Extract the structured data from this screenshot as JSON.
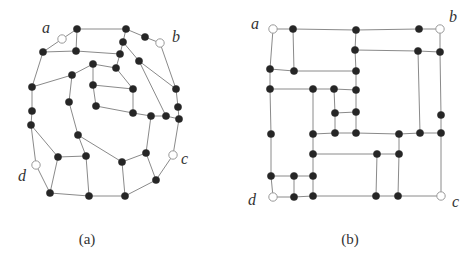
{
  "figures": [
    {
      "id": "a",
      "caption": "(a)",
      "caption_pos": [
        87,
        244
      ],
      "terminal_labels": [
        {
          "text": "a",
          "x": 42,
          "y": 33
        },
        {
          "text": "b",
          "x": 172,
          "y": 42
        },
        {
          "text": "c",
          "x": 181,
          "y": 164
        },
        {
          "text": "d",
          "x": 18,
          "y": 181
        }
      ],
      "nodes": [
        {
          "id": "A",
          "x": 62,
          "y": 39,
          "terminal": true
        },
        {
          "id": "B",
          "x": 160,
          "y": 43,
          "terminal": true
        },
        {
          "id": "C",
          "x": 173,
          "y": 155,
          "terminal": true
        },
        {
          "id": "D",
          "x": 36,
          "y": 165,
          "terminal": true
        },
        {
          "id": "p1",
          "x": 77,
          "y": 29
        },
        {
          "id": "p2",
          "x": 126,
          "y": 29
        },
        {
          "id": "p3",
          "x": 145,
          "y": 37
        },
        {
          "id": "p4",
          "x": 43,
          "y": 52
        },
        {
          "id": "p5",
          "x": 76,
          "y": 51
        },
        {
          "id": "p6",
          "x": 123,
          "y": 42
        },
        {
          "id": "p7",
          "x": 120,
          "y": 54
        },
        {
          "id": "p8",
          "x": 93,
          "y": 64
        },
        {
          "id": "p9",
          "x": 116,
          "y": 68
        },
        {
          "id": "p10",
          "x": 139,
          "y": 61
        },
        {
          "id": "p11",
          "x": 72,
          "y": 75
        },
        {
          "id": "p12",
          "x": 93,
          "y": 85
        },
        {
          "id": "p13",
          "x": 133,
          "y": 89
        },
        {
          "id": "p14",
          "x": 176,
          "y": 89
        },
        {
          "id": "p15",
          "x": 32,
          "y": 87
        },
        {
          "id": "p16",
          "x": 69,
          "y": 102
        },
        {
          "id": "p17",
          "x": 96,
          "y": 106
        },
        {
          "id": "p18",
          "x": 133,
          "y": 113
        },
        {
          "id": "p19",
          "x": 151,
          "y": 116
        },
        {
          "id": "p20",
          "x": 166,
          "y": 116
        },
        {
          "id": "p21",
          "x": 178,
          "y": 107
        },
        {
          "id": "p22",
          "x": 179,
          "y": 119
        },
        {
          "id": "p23",
          "x": 32,
          "y": 111
        },
        {
          "id": "p24",
          "x": 31,
          "y": 125
        },
        {
          "id": "p25",
          "x": 78,
          "y": 135
        },
        {
          "id": "p26",
          "x": 58,
          "y": 157
        },
        {
          "id": "p27",
          "x": 86,
          "y": 156
        },
        {
          "id": "p28",
          "x": 122,
          "y": 162
        },
        {
          "id": "p29",
          "x": 146,
          "y": 153
        },
        {
          "id": "p30",
          "x": 156,
          "y": 180
        },
        {
          "id": "p31",
          "x": 50,
          "y": 193
        },
        {
          "id": "p32",
          "x": 89,
          "y": 196
        },
        {
          "id": "p33",
          "x": 125,
          "y": 196
        }
      ],
      "edges": [
        [
          "A",
          "p1"
        ],
        [
          "A",
          "p4"
        ],
        [
          "p1",
          "p2"
        ],
        [
          "p1",
          "p5"
        ],
        [
          "p2",
          "p3"
        ],
        [
          "p2",
          "p6"
        ],
        [
          "p3",
          "B"
        ],
        [
          "B",
          "p14"
        ],
        [
          "p4",
          "p5"
        ],
        [
          "p5",
          "p7"
        ],
        [
          "p6",
          "p7"
        ],
        [
          "p6",
          "p10"
        ],
        [
          "p7",
          "p9"
        ],
        [
          "p9",
          "p8"
        ],
        [
          "p8",
          "p11"
        ],
        [
          "p11",
          "p15"
        ],
        [
          "p4",
          "p15"
        ],
        [
          "p15",
          "p23"
        ],
        [
          "p23",
          "p24"
        ],
        [
          "p8",
          "p12"
        ],
        [
          "p12",
          "p13"
        ],
        [
          "p13",
          "p9"
        ],
        [
          "p13",
          "p18"
        ],
        [
          "p11",
          "p16"
        ],
        [
          "p12",
          "p17"
        ],
        [
          "p17",
          "p18"
        ],
        [
          "p18",
          "p19"
        ],
        [
          "p19",
          "p20"
        ],
        [
          "p20",
          "p22"
        ],
        [
          "p10",
          "p20"
        ],
        [
          "p10",
          "p14"
        ],
        [
          "p14",
          "p21"
        ],
        [
          "p21",
          "p22"
        ],
        [
          "p19",
          "p29"
        ],
        [
          "p22",
          "C"
        ],
        [
          "C",
          "p30"
        ],
        [
          "p29",
          "p30"
        ],
        [
          "p29",
          "p28"
        ],
        [
          "p28",
          "p33"
        ],
        [
          "p33",
          "p30"
        ],
        [
          "p32",
          "p33"
        ],
        [
          "p31",
          "p32"
        ],
        [
          "p31",
          "D"
        ],
        [
          "D",
          "p24"
        ],
        [
          "p24",
          "p26"
        ],
        [
          "p26",
          "p27"
        ],
        [
          "p26",
          "p31"
        ],
        [
          "p27",
          "p32"
        ],
        [
          "p27",
          "p25"
        ],
        [
          "p25",
          "p16"
        ],
        [
          "p25",
          "p28"
        ]
      ]
    },
    {
      "id": "b",
      "caption": "(b)",
      "caption_pos": [
        350,
        244
      ],
      "terminal_labels": [
        {
          "text": "a",
          "x": 251,
          "y": 29
        },
        {
          "text": "b",
          "x": 449,
          "y": 22
        },
        {
          "text": "c",
          "x": 452,
          "y": 207
        },
        {
          "text": "d",
          "x": 248,
          "y": 205
        }
      ],
      "nodes": [
        {
          "id": "A",
          "x": 273,
          "y": 29,
          "terminal": true
        },
        {
          "id": "B",
          "x": 440,
          "y": 29,
          "terminal": true
        },
        {
          "id": "C",
          "x": 441,
          "y": 196,
          "terminal": true
        },
        {
          "id": "D",
          "x": 273,
          "y": 197,
          "terminal": true
        },
        {
          "id": "q1",
          "x": 293,
          "y": 29
        },
        {
          "id": "q2",
          "x": 356,
          "y": 30
        },
        {
          "id": "q3",
          "x": 419,
          "y": 29
        },
        {
          "id": "q4",
          "x": 355,
          "y": 50
        },
        {
          "id": "q5",
          "x": 418,
          "y": 51
        },
        {
          "id": "q6",
          "x": 440,
          "y": 52
        },
        {
          "id": "q7",
          "x": 270,
          "y": 69
        },
        {
          "id": "q8",
          "x": 294,
          "y": 71
        },
        {
          "id": "q9",
          "x": 356,
          "y": 71
        },
        {
          "id": "q10",
          "x": 270,
          "y": 89
        },
        {
          "id": "q11",
          "x": 313,
          "y": 89
        },
        {
          "id": "q12",
          "x": 334,
          "y": 89
        },
        {
          "id": "q13",
          "x": 356,
          "y": 90
        },
        {
          "id": "q14",
          "x": 335,
          "y": 113
        },
        {
          "id": "q15",
          "x": 356,
          "y": 112
        },
        {
          "id": "q16",
          "x": 441,
          "y": 115
        },
        {
          "id": "q17",
          "x": 271,
          "y": 134
        },
        {
          "id": "q18",
          "x": 313,
          "y": 134
        },
        {
          "id": "q19",
          "x": 335,
          "y": 133
        },
        {
          "id": "q20",
          "x": 356,
          "y": 133
        },
        {
          "id": "q21",
          "x": 399,
          "y": 134
        },
        {
          "id": "q22",
          "x": 420,
          "y": 133
        },
        {
          "id": "q23",
          "x": 441,
          "y": 133
        },
        {
          "id": "q24",
          "x": 313,
          "y": 154
        },
        {
          "id": "q25",
          "x": 377,
          "y": 154
        },
        {
          "id": "q26",
          "x": 399,
          "y": 154
        },
        {
          "id": "q27",
          "x": 271,
          "y": 176
        },
        {
          "id": "q28",
          "x": 294,
          "y": 176
        },
        {
          "id": "q29",
          "x": 313,
          "y": 176
        },
        {
          "id": "q30",
          "x": 294,
          "y": 197
        },
        {
          "id": "q31",
          "x": 313,
          "y": 196
        },
        {
          "id": "q32",
          "x": 376,
          "y": 196
        },
        {
          "id": "q33",
          "x": 398,
          "y": 196
        }
      ],
      "edges": [
        [
          "A",
          "q1"
        ],
        [
          "q1",
          "q2"
        ],
        [
          "q2",
          "q3"
        ],
        [
          "q3",
          "B"
        ],
        [
          "A",
          "q7"
        ],
        [
          "q1",
          "q8"
        ],
        [
          "q7",
          "q8"
        ],
        [
          "q8",
          "q9"
        ],
        [
          "q2",
          "q4"
        ],
        [
          "q4",
          "q9"
        ],
        [
          "q9",
          "q13"
        ],
        [
          "q13",
          "q15"
        ],
        [
          "q15",
          "q20"
        ],
        [
          "q4",
          "q5"
        ],
        [
          "q5",
          "q6"
        ],
        [
          "B",
          "q6"
        ],
        [
          "q6",
          "q16"
        ],
        [
          "q16",
          "q23"
        ],
        [
          "q23",
          "C"
        ],
        [
          "q5",
          "q22"
        ],
        [
          "q7",
          "q10"
        ],
        [
          "q10",
          "q17"
        ],
        [
          "q17",
          "q27"
        ],
        [
          "q27",
          "D"
        ],
        [
          "q10",
          "q11"
        ],
        [
          "q11",
          "q12"
        ],
        [
          "q12",
          "q13"
        ],
        [
          "q11",
          "q18"
        ],
        [
          "q18",
          "q24"
        ],
        [
          "q24",
          "q29"
        ],
        [
          "q29",
          "q31"
        ],
        [
          "q12",
          "q14"
        ],
        [
          "q14",
          "q15"
        ],
        [
          "q14",
          "q19"
        ],
        [
          "q18",
          "q19"
        ],
        [
          "q19",
          "q20"
        ],
        [
          "q20",
          "q21"
        ],
        [
          "q21",
          "q22"
        ],
        [
          "q22",
          "q23"
        ],
        [
          "q24",
          "q25"
        ],
        [
          "q25",
          "q26"
        ],
        [
          "q21",
          "q26"
        ],
        [
          "q26",
          "q33"
        ],
        [
          "q25",
          "q32"
        ],
        [
          "q27",
          "q28"
        ],
        [
          "q28",
          "q29"
        ],
        [
          "q28",
          "q30"
        ],
        [
          "D",
          "q30"
        ],
        [
          "q30",
          "q31"
        ],
        [
          "q31",
          "q32"
        ],
        [
          "q32",
          "q33"
        ],
        [
          "q33",
          "C"
        ]
      ]
    }
  ]
}
